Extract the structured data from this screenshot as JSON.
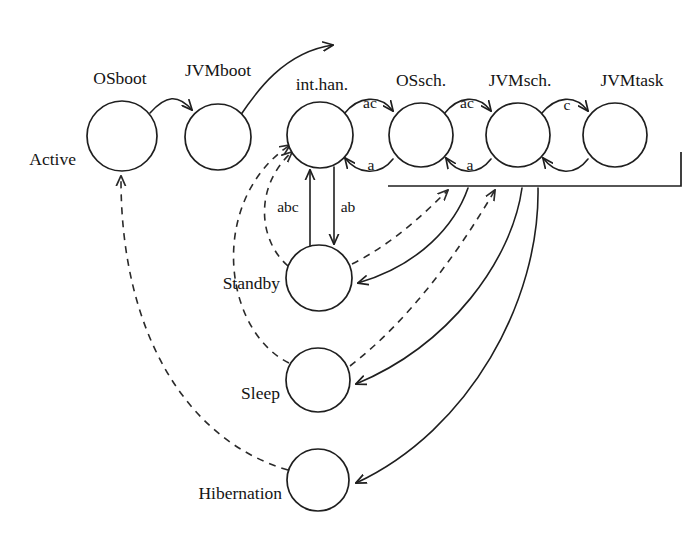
{
  "diagram": {
    "type": "state-transition-diagram",
    "title": "",
    "canvas": {
      "width": 695,
      "height": 541
    },
    "states": [
      {
        "id": "active",
        "label": "Active",
        "cx": 122,
        "cy": 136,
        "r": 35,
        "label_x": 76,
        "label_y": 165,
        "label_anchor": "end"
      },
      {
        "id": "jvmboot",
        "label": "JVMboot",
        "cx": 218,
        "cy": 137,
        "r": 33,
        "label_x": 218,
        "label_y": 76,
        "label_anchor": "middle"
      },
      {
        "id": "inthan",
        "label": "int.han.",
        "cx": 320,
        "cy": 135,
        "r": 33,
        "label_x": 322,
        "label_y": 90,
        "label_anchor": "middle"
      },
      {
        "id": "ossch",
        "label": "OSsch.",
        "cx": 421,
        "cy": 135,
        "r": 32,
        "label_x": 421,
        "label_y": 86,
        "label_anchor": "middle"
      },
      {
        "id": "jvmsch",
        "label": "JVMsch.",
        "cx": 518,
        "cy": 135,
        "r": 32,
        "label_x": 520,
        "label_y": 86,
        "label_anchor": "middle"
      },
      {
        "id": "jvmtask",
        "label": "JVMtask",
        "cx": 615,
        "cy": 135,
        "r": 32,
        "label_x": 632,
        "label_y": 86,
        "label_anchor": "middle"
      },
      {
        "id": "standby",
        "label": "Standby",
        "cx": 319,
        "cy": 278,
        "r": 33,
        "label_x": 280,
        "label_y": 289,
        "label_anchor": "end"
      },
      {
        "id": "sleep",
        "label": "Sleep",
        "cx": 318,
        "cy": 380,
        "r": 32,
        "label_x": 280,
        "label_y": 399,
        "label_anchor": "end"
      },
      {
        "id": "hibernation",
        "label": "Hibernation",
        "cx": 318,
        "cy": 480,
        "r": 31,
        "label_x": 282,
        "label_y": 499,
        "label_anchor": "end"
      }
    ],
    "osboot_label": {
      "text": "OSboot",
      "x": 120,
      "y": 84,
      "anchor": "middle"
    },
    "edge_labels": [
      {
        "id": "inthan-ossch-top",
        "text": "ac",
        "x": 370,
        "y": 108
      },
      {
        "id": "ossch-jvmsch-top",
        "text": "ac",
        "x": 467,
        "y": 108
      },
      {
        "id": "jvmsch-jvmtask-top",
        "text": "c",
        "x": 567,
        "y": 110
      },
      {
        "id": "ossch-inthan-bot",
        "text": "a",
        "x": 371,
        "y": 170
      },
      {
        "id": "jvmsch-ossch-bot",
        "text": "a",
        "x": 470,
        "y": 170
      },
      {
        "id": "standby-inthan",
        "text": "abc",
        "x": 288,
        "y": 212
      },
      {
        "id": "inthan-standby",
        "text": "ab",
        "x": 348,
        "y": 212
      }
    ],
    "transitions": [
      {
        "id": "osboot-jvmboot",
        "from": "active",
        "to": "jvmboot",
        "label": "OSboot",
        "style": "solid"
      },
      {
        "id": "jvmboot-out",
        "from": "jvmboot",
        "to": "exit",
        "label": "JVMboot",
        "style": "solid"
      },
      {
        "id": "inthan-ossch",
        "from": "inthan",
        "to": "ossch",
        "label": "ac",
        "style": "solid"
      },
      {
        "id": "ossch-jvmsch",
        "from": "ossch",
        "to": "jvmsch",
        "label": "ac",
        "style": "solid"
      },
      {
        "id": "jvmsch-jvmtask",
        "from": "jvmsch",
        "to": "jvmtask",
        "label": "c",
        "style": "solid"
      },
      {
        "id": "ossch-inthan",
        "from": "ossch",
        "to": "inthan",
        "label": "a",
        "style": "solid"
      },
      {
        "id": "jvmsch-ossch",
        "from": "jvmsch",
        "to": "ossch",
        "label": "a",
        "style": "solid"
      },
      {
        "id": "jvmtask-jvmsch",
        "from": "jvmtask",
        "to": "jvmsch",
        "label": "",
        "style": "solid"
      },
      {
        "id": "standby-inthan",
        "from": "standby",
        "to": "inthan",
        "label": "abc",
        "style": "solid"
      },
      {
        "id": "inthan-standby",
        "from": "inthan",
        "to": "standby",
        "label": "ab",
        "style": "solid"
      },
      {
        "id": "bus-standby",
        "from": "bus",
        "to": "standby",
        "label": "",
        "style": "solid"
      },
      {
        "id": "bus-sleep",
        "from": "bus",
        "to": "sleep",
        "label": "",
        "style": "solid"
      },
      {
        "id": "bus-hibernation",
        "from": "bus",
        "to": "hibernation",
        "label": "",
        "style": "solid"
      },
      {
        "id": "standby-bus",
        "from": "standby",
        "to": "bus",
        "label": "",
        "style": "dashed"
      },
      {
        "id": "sleep-bus",
        "from": "sleep",
        "to": "bus",
        "label": "",
        "style": "dashed"
      },
      {
        "id": "standby-inthan-dash",
        "from": "standby",
        "to": "inthan",
        "label": "",
        "style": "dashed"
      },
      {
        "id": "sleep-inthan-dash",
        "from": "sleep",
        "to": "inthan",
        "label": "",
        "style": "dashed"
      },
      {
        "id": "hibernation-active",
        "from": "hibernation",
        "to": "active",
        "label": "",
        "style": "dashed"
      }
    ],
    "bracket": {
      "x_left": 388,
      "x_right": 681,
      "y": 186,
      "y_top": 152
    }
  }
}
